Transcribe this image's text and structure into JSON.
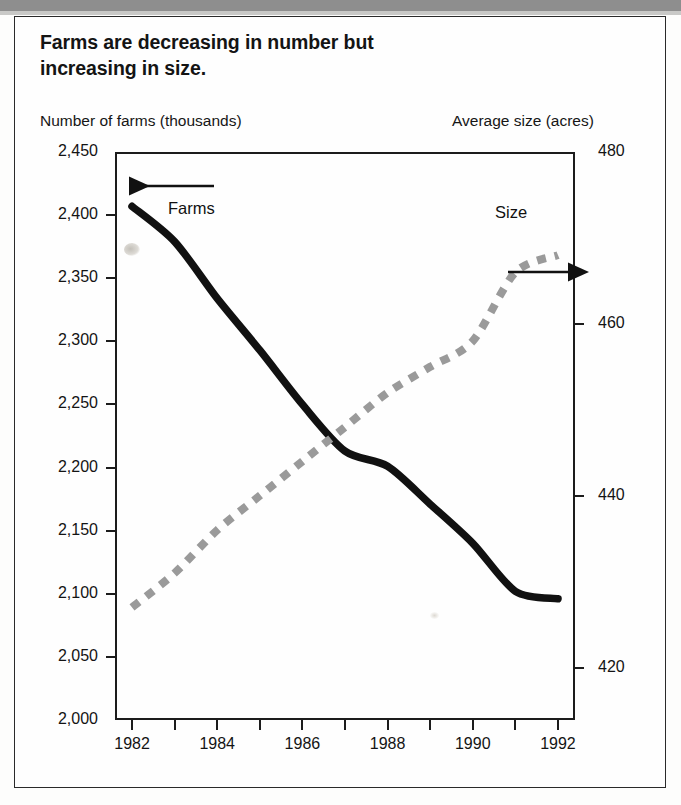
{
  "figure": {
    "title": "Farms are decreasing in number but increasing in size.",
    "left_axis_caption": "Number of farms (thousands)",
    "right_axis_caption": "Average size (acres)"
  },
  "annotations": {
    "farms_label": "Farms",
    "size_label": "Size",
    "farms_arrow": "arrow-left-icon",
    "size_arrow": "arrow-right-icon"
  },
  "colors": {
    "farms_line": "#111111",
    "size_line": "#9a9a9a",
    "axis": "#1c1c1c",
    "text": "#141414",
    "frame": "#2a2a2a"
  },
  "chart_data": {
    "type": "line",
    "title": "Farms are decreasing in number but increasing in size.",
    "xlabel": "",
    "ylabel": "Number of farms (thousands)",
    "y2label": "Average size (acres)",
    "grid": false,
    "legend": "inline-annotations",
    "x": [
      1982,
      1983,
      1984,
      1985,
      1986,
      1987,
      1988,
      1989,
      1990,
      1991,
      1992
    ],
    "xlim": [
      1981.6,
      1992.4
    ],
    "xticks": [
      1982,
      1983,
      1984,
      1985,
      1986,
      1987,
      1988,
      1989,
      1990,
      1991,
      1992
    ],
    "xticklabels": [
      "1982",
      "",
      "1984",
      "",
      "1986",
      "",
      "1988",
      "",
      "1990",
      "",
      "1992"
    ],
    "ylim": [
      2000,
      2450
    ],
    "yticks": [
      2000,
      2050,
      2100,
      2150,
      2200,
      2250,
      2300,
      2350,
      2400,
      2450
    ],
    "yticklabels": [
      "2,000",
      "2,050",
      "2,100",
      "2,150",
      "2,200",
      "2,250",
      "2,300",
      "2,350",
      "2,400",
      "2,450"
    ],
    "y2lim": [
      413.9,
      480
    ],
    "y2ticks": [
      420,
      440,
      460,
      480
    ],
    "y2ticklabels": [
      "420",
      "440",
      "460",
      "480"
    ],
    "series": [
      {
        "name": "Farms",
        "axis": "left",
        "style": "solid",
        "color": "#111111",
        "unit": "thousands of farms",
        "values": [
          2407,
          2379,
          2334,
          2293,
          2250,
          2213,
          2201,
          2171,
          2140,
          2102,
          2096
        ]
      },
      {
        "name": "Size",
        "axis": "right",
        "style": "dashed",
        "color": "#9a9a9a",
        "unit": "acres",
        "values": [
          427,
          431,
          436,
          440,
          444,
          448,
          452,
          455,
          458,
          466,
          468
        ]
      }
    ]
  }
}
